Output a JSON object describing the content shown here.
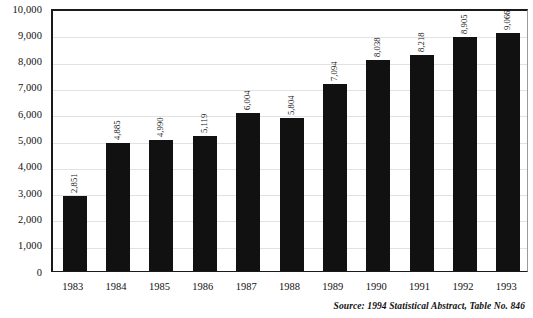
{
  "chart_data": {
    "type": "bar",
    "title": "",
    "subtitle": "",
    "xlabel": "",
    "ylabel": "",
    "categories": [
      "1983",
      "1984",
      "1985",
      "1986",
      "1987",
      "1988",
      "1989",
      "1990",
      "1991",
      "1992",
      "1993"
    ],
    "values": [
      2851,
      4885,
      4990,
      5119,
      6004,
      5804,
      7094,
      8038,
      8218,
      8905,
      9066
    ],
    "value_labels": [
      "2,851",
      "4,885",
      "4,990",
      "5,119",
      "6,004",
      "5,804",
      "7,094",
      "8,038",
      "8,218",
      "8,905",
      "9,066"
    ],
    "ylim": [
      0,
      10000
    ],
    "ytick_values": [
      0,
      1000,
      2000,
      3000,
      4000,
      5000,
      6000,
      7000,
      8000,
      9000,
      10000
    ],
    "ytick_labels": [
      "0",
      "1,000",
      "2,000",
      "3,000",
      "4,000",
      "5,000",
      "6,000",
      "7,000",
      "8,000",
      "9,000",
      "10,000"
    ],
    "grid": true,
    "grid_axis": "y",
    "legend": false,
    "legend_position": "none",
    "bar_color": "#111111",
    "gridline_color": "#e2e2e2",
    "axis_color": "#1a1a1a",
    "background_color": "#ffffff",
    "value_label_rotation": -90
  },
  "source": {
    "text": "Source: 1994 Statistical Abstract, Table No. 846"
  }
}
